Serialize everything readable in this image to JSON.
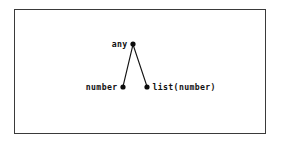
{
  "figure": {
    "kind": "type-lattice-diagram",
    "width": 281,
    "height": 149,
    "background_color": "#ffffff",
    "border_color": "#3a3a3a"
  },
  "diagram_data": {
    "type": "graph",
    "layout": "hasse-lattice",
    "orientation": "top-down",
    "node_color": "#0c0c0c",
    "edge_color": "#121212",
    "nodes": [
      {
        "id": "any",
        "label": "any",
        "x": 133,
        "y": 44,
        "label_side": "left",
        "level": 0
      },
      {
        "id": "number",
        "label": "number",
        "x": 123,
        "y": 87,
        "label_side": "left",
        "level": 1
      },
      {
        "id": "list_number",
        "label": "list(number)",
        "x": 147,
        "y": 87,
        "label_side": "right",
        "level": 1
      }
    ],
    "edges": [
      {
        "from": "any",
        "to": "number"
      },
      {
        "from": "any",
        "to": "list_number"
      }
    ]
  },
  "labels": {
    "root": "any",
    "left_child": "number",
    "right_child": "list(number)"
  }
}
